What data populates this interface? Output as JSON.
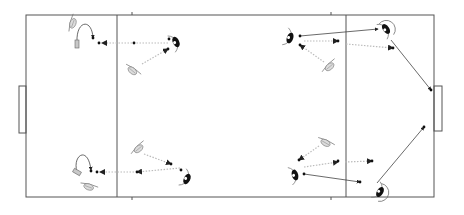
{
  "diagram": {
    "title": "",
    "type": "tactical pitch drill",
    "pitch": {
      "outer": {
        "x1": 26,
        "y1": 15,
        "x2": 434,
        "y2": 197
      },
      "zone_lines_x": [
        117,
        346
      ],
      "tick_marks_x": [
        132,
        331
      ],
      "left_goal": {
        "x1": 19,
        "y1": 86,
        "x2": 26,
        "y2": 133
      },
      "right_goal": {
        "x1": 434,
        "y1": 86,
        "x2": 442,
        "y2": 131
      }
    },
    "colors": {
      "lines": "#555555",
      "pass": "#bbbbbb",
      "run": "#444444",
      "player_dark": "#111111",
      "player_light": "#dcdcdc"
    },
    "players": [
      {
        "id": "p1",
        "team": "dark",
        "x": 176,
        "y": 42,
        "rotation": -25,
        "label": ""
      },
      {
        "id": "p2",
        "team": "dark",
        "x": 290,
        "y": 38,
        "rotation": 20,
        "label": ""
      },
      {
        "id": "p3",
        "team": "dark",
        "x": 386,
        "y": 29,
        "rotation": -35,
        "ring": true,
        "label": ""
      },
      {
        "id": "p4",
        "team": "dark",
        "x": 187,
        "y": 179,
        "rotation": 25,
        "label": ""
      },
      {
        "id": "p5",
        "team": "dark",
        "x": 295,
        "y": 175,
        "rotation": -15,
        "label": ""
      },
      {
        "id": "p6",
        "team": "dark",
        "x": 380,
        "y": 192,
        "rotation": 30,
        "ring": true,
        "label": ""
      },
      {
        "id": "p7",
        "team": "light",
        "x": 72,
        "y": 23,
        "rotation": -70,
        "label": ""
      },
      {
        "id": "p8",
        "team": "light",
        "x": 133,
        "y": 70,
        "rotation": 40,
        "label": ""
      },
      {
        "id": "p9",
        "team": "light",
        "x": 329,
        "y": 66,
        "rotation": -40,
        "label": ""
      },
      {
        "id": "p10",
        "team": "light",
        "x": 138,
        "y": 148,
        "rotation": -40,
        "label": ""
      },
      {
        "id": "p11",
        "team": "light",
        "x": 89,
        "y": 186,
        "rotation": 20,
        "label": ""
      },
      {
        "id": "p12",
        "team": "light",
        "x": 326,
        "y": 142,
        "rotation": 30,
        "label": ""
      }
    ],
    "cones": [
      {
        "id": "c1",
        "x": 77,
        "y": 44,
        "w": 4,
        "h": 8,
        "rotation": 0
      },
      {
        "id": "c2",
        "x": 77,
        "y": 172,
        "w": 4,
        "h": 8,
        "rotation": -60
      }
    ],
    "balls": [
      {
        "x": 93,
        "y": 38
      },
      {
        "x": 99,
        "y": 43
      },
      {
        "x": 134,
        "y": 43
      },
      {
        "x": 169,
        "y": 39
      },
      {
        "x": 168,
        "y": 49
      },
      {
        "x": 300,
        "y": 36
      },
      {
        "x": 300,
        "y": 45
      },
      {
        "x": 338,
        "y": 41
      },
      {
        "x": 393,
        "y": 48
      },
      {
        "x": 431,
        "y": 90
      },
      {
        "x": 91,
        "y": 171
      },
      {
        "x": 97,
        "y": 172
      },
      {
        "x": 137,
        "y": 172
      },
      {
        "x": 171,
        "y": 164
      },
      {
        "x": 181,
        "y": 170
      },
      {
        "x": 299,
        "y": 160
      },
      {
        "x": 304,
        "y": 174
      },
      {
        "x": 338,
        "y": 161
      },
      {
        "x": 372,
        "y": 161
      },
      {
        "x": 360,
        "y": 182
      },
      {
        "x": 424,
        "y": 127
      }
    ],
    "passes": [
      {
        "from": [
          168,
          43
        ],
        "to": [
          102,
          43
        ]
      },
      {
        "from": [
          142,
          64
        ],
        "to": [
          168,
          49
        ]
      },
      {
        "from": [
          304,
          41
        ],
        "to": [
          338,
          41
        ]
      },
      {
        "from": [
          324,
          62
        ],
        "to": [
          300,
          45
        ]
      },
      {
        "from": [
          346,
          44
        ],
        "to": [
          393,
          48
        ]
      },
      {
        "from": [
          180,
          168
        ],
        "to": [
          137,
          172
        ]
      },
      {
        "from": [
          134,
          172
        ],
        "to": [
          100,
          172
        ]
      },
      {
        "from": [
          144,
          154
        ],
        "to": [
          171,
          164
        ]
      },
      {
        "from": [
          304,
          167
        ],
        "to": [
          338,
          162
        ]
      },
      {
        "from": [
          345,
          162
        ],
        "to": [
          372,
          161
        ]
      },
      {
        "from": [
          319,
          146
        ],
        "to": [
          299,
          160
        ]
      }
    ],
    "runs": [
      {
        "from": [
          300,
          36
        ],
        "to": [
          378,
          29
        ]
      },
      {
        "from": [
          391,
          40
        ],
        "to": [
          431,
          90
        ]
      },
      {
        "from": [
          304,
          174
        ],
        "to": [
          360,
          182
        ]
      },
      {
        "from": [
          377,
          183
        ],
        "to": [
          424,
          127
        ]
      }
    ],
    "curved_runs": [
      {
        "d": "M77 42 C 76 20, 92 18, 93 38"
      },
      {
        "d": "M77 172 C 72 155, 88 145, 91 170"
      }
    ]
  }
}
